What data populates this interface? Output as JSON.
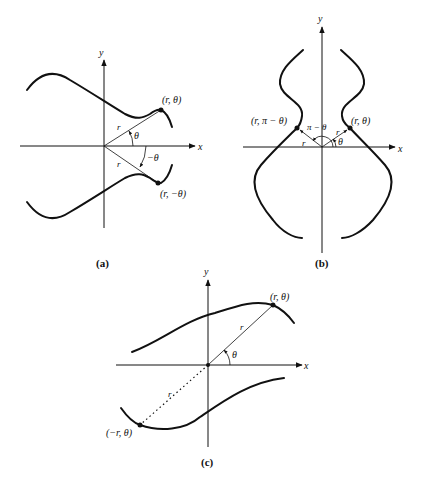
{
  "figure": {
    "panels": [
      {
        "id": "a",
        "caption": "(a)",
        "axes": {
          "x_label": "x",
          "y_label": "y"
        },
        "points": [
          {
            "label": "(r, θ)"
          },
          {
            "label": "(r, −θ)"
          }
        ],
        "ray_labels": [
          "r",
          "r"
        ],
        "angle_labels": [
          "θ",
          "−θ"
        ],
        "description": "Symmetry about the polar axis (x-axis)"
      },
      {
        "id": "b",
        "caption": "(b)",
        "axes": {
          "x_label": "x",
          "y_label": "y"
        },
        "points": [
          {
            "label": "(r, π − θ)"
          },
          {
            "label": "(r, θ)"
          }
        ],
        "ray_labels": [
          "r",
          "r"
        ],
        "angle_labels": [
          "π − θ",
          "θ"
        ],
        "description": "Symmetry about the line θ = π/2 (y-axis)"
      },
      {
        "id": "c",
        "caption": "(c)",
        "axes": {
          "x_label": "x",
          "y_label": "y"
        },
        "points": [
          {
            "label": "(r, θ)"
          },
          {
            "label": "(−r, θ)"
          }
        ],
        "ray_labels": [
          "r",
          "r"
        ],
        "angle_labels": [
          "θ"
        ],
        "description": "Symmetry about the pole (origin)"
      }
    ]
  }
}
